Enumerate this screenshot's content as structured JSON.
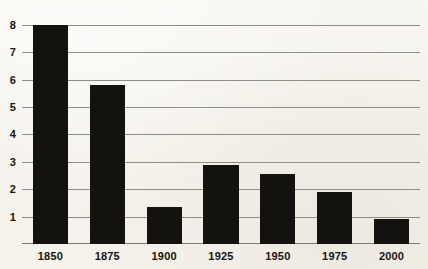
{
  "chart_data": {
    "type": "bar",
    "title": "",
    "subtitle": "",
    "xlabel": "",
    "ylabel": "",
    "categories": [
      "1850",
      "1875",
      "1900",
      "1925",
      "1950",
      "1975",
      "2000"
    ],
    "values": [
      8.0,
      5.8,
      1.35,
      2.9,
      2.55,
      1.9,
      0.9
    ],
    "series": [
      {
        "name": "",
        "values": [
          8.0,
          5.8,
          1.35,
          2.9,
          2.55,
          1.9,
          0.9
        ]
      }
    ],
    "ylim": [
      0,
      8.4
    ],
    "xlim": [
      0,
      7
    ],
    "yticks": [
      1,
      2,
      3,
      4,
      5,
      6,
      7,
      8
    ],
    "ytick_labels": [
      "1",
      "2",
      "3",
      "4",
      "5",
      "6",
      "7",
      "8"
    ],
    "xtick_labels": [
      "1850",
      "1875",
      "1900",
      "1925",
      "1950",
      "1975",
      "2000"
    ],
    "grid": "horizontal",
    "legend": "none",
    "annotations": [],
    "colors": {
      "bar": "#14120e",
      "gridline": "#8d8d85",
      "axis": "#7c7c74",
      "background": "#f6f4ef",
      "text": "#16150f"
    }
  }
}
